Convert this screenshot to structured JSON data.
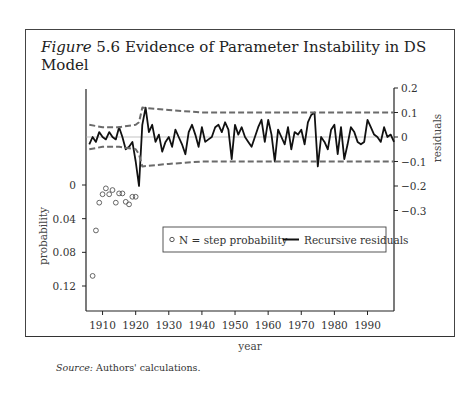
{
  "figure": {
    "label": "Figure",
    "number": "5.6",
    "title": "Evidence of Parameter Instability in DS Model",
    "source_label": "Source:",
    "source_text": "Authors' calculations."
  },
  "chart_data": {
    "type": "line",
    "title": "Figure 5.6 Evidence of Parameter Instability in DS Model",
    "xlabel": "year",
    "ylabel_left": "probability",
    "ylabel_right": "residuals",
    "xlim": [
      1905,
      1998
    ],
    "x_ticks": [
      "1910",
      "1920",
      "1930",
      "1940",
      "1950",
      "1960",
      "1970",
      "1980",
      "1990"
    ],
    "y_left_ticks": [
      "0",
      "0.04",
      "0.08",
      "0.12"
    ],
    "y_left_range_inverted": [
      0,
      0.13
    ],
    "y_right_ticks": [
      "0.2",
      "0.1",
      "0",
      "-0.1",
      "-0.2",
      "-0.3"
    ],
    "y_right_range": [
      -0.3,
      0.2
    ],
    "legend": [
      "N = step probability",
      "Recursive residuals"
    ],
    "legend_position": "inside, center",
    "series": [
      {
        "name": "N = step probability",
        "style": "hollow circles",
        "x": [
          1907,
          1908,
          1909,
          1910,
          1911,
          1912,
          1913,
          1914,
          1915,
          1916,
          1917,
          1918,
          1919,
          1920
        ],
        "values": [
          0.108,
          0.054,
          0.021,
          0.011,
          0.004,
          0.011,
          0.006,
          0.021,
          0.01,
          0.01,
          0.02,
          0.023,
          0.014,
          0.014
        ]
      },
      {
        "name": "Recursive residuals",
        "style": "solid black line",
        "x": [
          1906,
          1907,
          1908,
          1909,
          1910,
          1911,
          1912,
          1913,
          1914,
          1915,
          1916,
          1917,
          1918,
          1919,
          1920,
          1921,
          1922,
          1923,
          1924,
          1925,
          1926,
          1927,
          1928,
          1929,
          1930,
          1931,
          1932,
          1933,
          1934,
          1935,
          1936,
          1937,
          1938,
          1939,
          1940,
          1941,
          1942,
          1943,
          1944,
          1945,
          1946,
          1947,
          1948,
          1949,
          1950,
          1951,
          1952,
          1953,
          1954,
          1955,
          1956,
          1957,
          1958,
          1959,
          1960,
          1961,
          1962,
          1963,
          1964,
          1965,
          1966,
          1967,
          1968,
          1969,
          1970,
          1971,
          1972,
          1973,
          1974,
          1975,
          1976,
          1977,
          1978,
          1979,
          1980,
          1981,
          1982,
          1983,
          1984,
          1985,
          1986,
          1987,
          1988,
          1989,
          1990,
          1991,
          1992,
          1993,
          1994,
          1995,
          1996,
          1997,
          1998
        ],
        "values": [
          -0.03,
          0.0,
          -0.02,
          0.02,
          0.0,
          -0.01,
          0.02,
          0.0,
          -0.01,
          0.04,
          0.0,
          -0.05,
          -0.04,
          -0.02,
          -0.1,
          -0.2,
          0.05,
          0.12,
          0.02,
          0.05,
          -0.02,
          0.01,
          -0.06,
          -0.02,
          0.0,
          -0.04,
          0.03,
          0.0,
          -0.03,
          -0.07,
          0.02,
          0.05,
          0.01,
          -0.04,
          0.04,
          -0.02,
          -0.01,
          0.0,
          0.04,
          0.05,
          0.02,
          0.06,
          0.03,
          -0.09,
          0.05,
          0.01,
          0.04,
          0.0,
          -0.02,
          -0.04,
          0.0,
          0.04,
          0.07,
          -0.02,
          0.07,
          0.01,
          -0.1,
          0.03,
          0.0,
          -0.03,
          0.04,
          -0.05,
          0.02,
          0.01,
          0.03,
          -0.03,
          0.06,
          0.09,
          0.1,
          -0.12,
          0.0,
          -0.02,
          -0.05,
          0.03,
          0.05,
          -0.07,
          0.04,
          -0.09,
          -0.03,
          0.04,
          0.02,
          -0.02,
          -0.03,
          -0.02,
          0.07,
          0.04,
          0.01,
          0.0,
          -0.02,
          0.04,
          0.0,
          0.01,
          -0.02
        ]
      },
      {
        "name": "Upper bound",
        "style": "dashed gray",
        "x": [
          1906,
          1910,
          1915,
          1920,
          1921,
          1922,
          1930,
          1940,
          1950,
          1960,
          1970,
          1974,
          1980,
          1990,
          1998
        ],
        "values": [
          0.05,
          0.04,
          0.04,
          0.05,
          0.06,
          0.12,
          0.11,
          0.1,
          0.1,
          0.1,
          0.1,
          0.1,
          0.1,
          0.1,
          0.1
        ]
      },
      {
        "name": "Lower bound",
        "style": "dashed gray",
        "x": [
          1906,
          1910,
          1915,
          1920,
          1921,
          1922,
          1930,
          1940,
          1950,
          1960,
          1970,
          1974,
          1980,
          1990,
          1998
        ],
        "values": [
          -0.05,
          -0.04,
          -0.04,
          -0.05,
          -0.07,
          -0.12,
          -0.11,
          -0.1,
          -0.1,
          -0.1,
          -0.1,
          -0.1,
          -0.1,
          -0.1,
          -0.1
        ]
      }
    ],
    "grid": false
  }
}
